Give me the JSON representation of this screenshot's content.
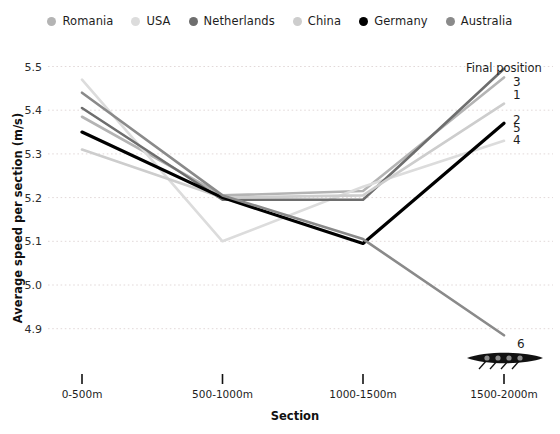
{
  "legend": {
    "position": "top",
    "items": [
      {
        "label": "Romania",
        "color": "#b4b4b4"
      },
      {
        "label": "USA",
        "color": "#dcdcdc"
      },
      {
        "label": "Netherlands",
        "color": "#6e6e6e"
      },
      {
        "label": "China",
        "color": "#cdcdcd"
      },
      {
        "label": "Germany",
        "color": "#000000"
      },
      {
        "label": "Australia",
        "color": "#8a8a8a"
      }
    ]
  },
  "annotations": {
    "final_position_title": "Final position",
    "end_labels": [
      {
        "text": "3",
        "series": "Netherlands"
      },
      {
        "text": "1",
        "series": "Romania"
      },
      {
        "text": "2",
        "series": "China"
      },
      {
        "text": "5",
        "series": "Germany"
      },
      {
        "text": "4",
        "series": "USA"
      },
      {
        "text": "6",
        "series": "Australia"
      }
    ],
    "boat_icon": "rowing-boat-icon"
  },
  "chart_data": {
    "type": "line",
    "title": "",
    "xlabel": "Section",
    "ylabel": "Average speed per section (m/s)",
    "categories": [
      "0-500m",
      "500-1000m",
      "1000-1500m",
      "1500-2000m"
    ],
    "ylim": [
      4.86,
      5.53
    ],
    "yticks": [
      4.9,
      5.0,
      5.1,
      5.2,
      5.3,
      5.4,
      5.5
    ],
    "ytick_labels": [
      "4.9",
      "5.0",
      "5.1",
      "5.2",
      "5.3",
      "5.4",
      "5.5"
    ],
    "grid": "horizontal-dotted",
    "legend_position": "top",
    "series": [
      {
        "name": "Romania",
        "color": "#b4b4b4",
        "width": 2.6,
        "final_position": 1,
        "values": [
          5.385,
          5.205,
          5.215,
          5.475
        ]
      },
      {
        "name": "USA",
        "color": "#dcdcdc",
        "width": 2.6,
        "final_position": 4,
        "values": [
          5.47,
          5.1,
          5.225,
          5.33
        ]
      },
      {
        "name": "Netherlands",
        "color": "#6e6e6e",
        "width": 2.6,
        "final_position": 3,
        "values": [
          5.405,
          5.195,
          5.195,
          5.495
        ]
      },
      {
        "name": "China",
        "color": "#cdcdcd",
        "width": 2.6,
        "final_position": 2,
        "values": [
          5.31,
          5.2,
          5.205,
          5.415
        ]
      },
      {
        "name": "Germany",
        "color": "#000000",
        "width": 3.2,
        "final_position": 5,
        "values": [
          5.35,
          5.2,
          5.095,
          5.37
        ]
      },
      {
        "name": "Australia",
        "color": "#8a8a8a",
        "width": 2.6,
        "final_position": 6,
        "values": [
          5.44,
          5.205,
          5.105,
          4.885
        ]
      }
    ]
  }
}
